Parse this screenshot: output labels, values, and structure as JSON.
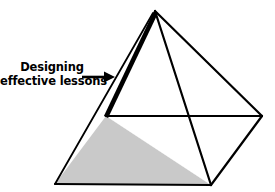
{
  "figure": {
    "type": "labeled-diagram",
    "background_color": "#ffffff",
    "stroke_color": "#000000",
    "base_fill_color": "#c9c9c9",
    "upper_fill_color": "#ffffff"
  },
  "callout": {
    "line1": "Designing",
    "line2": "effective lessons",
    "text_color": "#000000",
    "arrow_direction": "right"
  },
  "geometry": {
    "apex": [
      155,
      11
    ],
    "bottom_left": [
      55,
      184
    ],
    "bottom_front": [
      211,
      185
    ],
    "right": [
      262,
      116
    ],
    "cut_line_y": 116,
    "cut_left_x": 106,
    "cut_right_x": 262,
    "highlight_edge_width": 4
  }
}
